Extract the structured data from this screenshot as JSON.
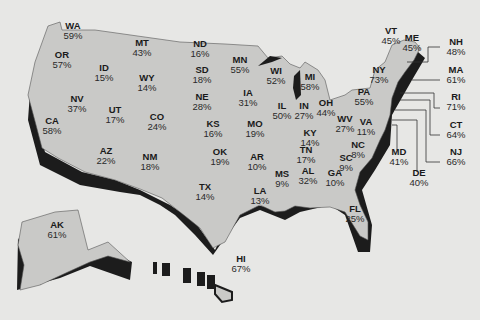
{
  "map": {
    "subject": "United States by state",
    "fill_color": "#c9c9c7",
    "shadow_color": "#1c1c1c",
    "background_color": "#e7e7e5",
    "states": [
      {
        "abbr": "WA",
        "value": "59%",
        "x": 73,
        "y": 29
      },
      {
        "abbr": "OR",
        "value": "57%",
        "x": 62,
        "y": 58
      },
      {
        "abbr": "ID",
        "value": "15%",
        "x": 104,
        "y": 71
      },
      {
        "abbr": "MT",
        "value": "43%",
        "x": 142,
        "y": 46
      },
      {
        "abbr": "WY",
        "value": "14%",
        "x": 147,
        "y": 81
      },
      {
        "abbr": "ND",
        "value": "16%",
        "x": 200,
        "y": 47
      },
      {
        "abbr": "SD",
        "value": "18%",
        "x": 202,
        "y": 73
      },
      {
        "abbr": "NE",
        "value": "28%",
        "x": 202,
        "y": 100
      },
      {
        "abbr": "MN",
        "value": "55%",
        "x": 240,
        "y": 63
      },
      {
        "abbr": "NV",
        "value": "37%",
        "x": 77,
        "y": 102
      },
      {
        "abbr": "CA",
        "value": "58%",
        "x": 52,
        "y": 124
      },
      {
        "abbr": "UT",
        "value": "17%",
        "x": 115,
        "y": 113
      },
      {
        "abbr": "CO",
        "value": "24%",
        "x": 157,
        "y": 120
      },
      {
        "abbr": "KS",
        "value": "16%",
        "x": 213,
        "y": 127
      },
      {
        "abbr": "IA",
        "value": "31%",
        "x": 248,
        "y": 96
      },
      {
        "abbr": "MO",
        "value": "19%",
        "x": 255,
        "y": 127
      },
      {
        "abbr": "WI",
        "value": "52%",
        "x": 276,
        "y": 74
      },
      {
        "abbr": "MI",
        "value": "58%",
        "x": 310,
        "y": 80
      },
      {
        "abbr": "IL",
        "value": "50%",
        "x": 282,
        "y": 109
      },
      {
        "abbr": "IN",
        "value": "27%",
        "x": 304,
        "y": 109
      },
      {
        "abbr": "OH",
        "value": "44%",
        "x": 326,
        "y": 106
      },
      {
        "abbr": "AZ",
        "value": "22%",
        "x": 106,
        "y": 154
      },
      {
        "abbr": "NM",
        "value": "18%",
        "x": 150,
        "y": 160
      },
      {
        "abbr": "OK",
        "value": "19%",
        "x": 220,
        "y": 155
      },
      {
        "abbr": "TX",
        "value": "14%",
        "x": 205,
        "y": 190
      },
      {
        "abbr": "AR",
        "value": "10%",
        "x": 257,
        "y": 160
      },
      {
        "abbr": "LA",
        "value": "13%",
        "x": 260,
        "y": 194
      },
      {
        "abbr": "MS",
        "value": "9%",
        "x": 282,
        "y": 177
      },
      {
        "abbr": "AL",
        "value": "32%",
        "x": 308,
        "y": 174
      },
      {
        "abbr": "GA",
        "value": "10%",
        "x": 335,
        "y": 176
      },
      {
        "abbr": "FL",
        "value": "25%",
        "x": 355,
        "y": 212
      },
      {
        "abbr": "SC",
        "value": "9%",
        "x": 346,
        "y": 161
      },
      {
        "abbr": "NC",
        "value": "8%",
        "x": 358,
        "y": 148
      },
      {
        "abbr": "TN",
        "value": "17%",
        "x": 306,
        "y": 153
      },
      {
        "abbr": "KY",
        "value": "14%",
        "x": 310,
        "y": 136
      },
      {
        "abbr": "WV",
        "value": "27%",
        "x": 345,
        "y": 122
      },
      {
        "abbr": "VA",
        "value": "11%",
        "x": 366,
        "y": 125
      },
      {
        "abbr": "PA",
        "value": "55%",
        "x": 364,
        "y": 95
      },
      {
        "abbr": "NY",
        "value": "73%",
        "x": 379,
        "y": 73
      },
      {
        "abbr": "VT",
        "value": "45%",
        "x": 391,
        "y": 34
      },
      {
        "abbr": "ME",
        "value": "45%",
        "x": 412,
        "y": 41
      },
      {
        "abbr": "NH",
        "value": "48%",
        "x": 456,
        "y": 45
      },
      {
        "abbr": "MA",
        "value": "61%",
        "x": 456,
        "y": 73
      },
      {
        "abbr": "RI",
        "value": "71%",
        "x": 456,
        "y": 100
      },
      {
        "abbr": "CT",
        "value": "64%",
        "x": 456,
        "y": 128
      },
      {
        "abbr": "NJ",
        "value": "66%",
        "x": 456,
        "y": 155
      },
      {
        "abbr": "MD",
        "value": "41%",
        "x": 399,
        "y": 155
      },
      {
        "abbr": "DE",
        "value": "40%",
        "x": 419,
        "y": 176
      },
      {
        "abbr": "AK",
        "value": "61%",
        "x": 57,
        "y": 228
      },
      {
        "abbr": "HI",
        "value": "67%",
        "x": 241,
        "y": 262
      }
    ]
  }
}
